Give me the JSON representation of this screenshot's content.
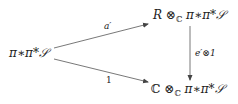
{
  "diagram": {
    "type": "commutative-triangle",
    "nodes": {
      "left": {
        "text": "π∗π*𝒮"
      },
      "top_right": {
        "prefix": "R ⊗",
        "subscript": "ℂ",
        "suffix": " π∗π*𝒮"
      },
      "bottom_right": {
        "prefix": "ℂ ⊗",
        "subscript": "ℂ",
        "suffix": " π∗π*𝒮"
      }
    },
    "arrows": [
      {
        "from": "left",
        "to": "top_right",
        "label": "a′"
      },
      {
        "from": "left",
        "to": "bottom_right",
        "label": "1"
      },
      {
        "from": "top_right",
        "to": "bottom_right",
        "label": "e′⊗1"
      }
    ],
    "colors": {
      "line": "#444444",
      "text": "#222222"
    }
  }
}
